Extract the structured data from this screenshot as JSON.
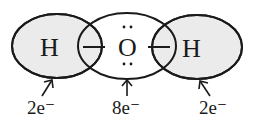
{
  "diagram": {
    "title": "",
    "atoms": [
      {
        "symbol": "H",
        "electron_label": "2e⁻"
      },
      {
        "symbol": "O",
        "electron_label": "8e⁻",
        "lone_pairs": 2
      },
      {
        "symbol": "H",
        "electron_label": "2e⁻"
      }
    ],
    "bond_symbol": "—",
    "lone_pair_symbol": "∶",
    "colors": {
      "fill": "#ebebeb",
      "stroke": "#1a1a1a",
      "background": "#ffffff"
    }
  }
}
